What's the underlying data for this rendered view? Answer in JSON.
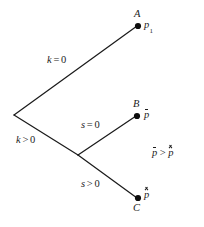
{
  "figure": {
    "type": "decision-tree-diagram",
    "background_color": "#ffffff",
    "ink_color": "#1b1b1b",
    "width": 204,
    "height": 227,
    "root_vertex": {
      "x": 14,
      "y": 115
    },
    "second_vertex": {
      "x": 78,
      "y": 155
    }
  },
  "edges": [
    {
      "id": "root-to-A",
      "label": "k = 0",
      "variable": "k",
      "operator": "=",
      "value": "0",
      "from": {
        "x": 14,
        "y": 115
      },
      "to": {
        "x": 137,
        "y": 26
      },
      "label_pos": {
        "x": 47,
        "y": 55
      }
    },
    {
      "id": "root-to-split",
      "label": "k > 0",
      "variable": "k",
      "operator": ">",
      "value": "0",
      "from": {
        "x": 14,
        "y": 115
      },
      "to": {
        "x": 78,
        "y": 155
      },
      "label_pos": {
        "x": 16,
        "y": 135
      }
    },
    {
      "id": "split-to-B",
      "label": "s = 0",
      "variable": "s",
      "operator": "=",
      "value": "0",
      "from": {
        "x": 78,
        "y": 155
      },
      "to": {
        "x": 136,
        "y": 116
      },
      "label_pos": {
        "x": 81,
        "y": 120
      }
    },
    {
      "id": "split-to-C",
      "label": "s > 0",
      "variable": "s",
      "operator": ">",
      "value": "0",
      "from": {
        "x": 78,
        "y": 155
      },
      "to": {
        "x": 137,
        "y": 198
      },
      "label_pos": {
        "x": 81,
        "y": 179
      }
    }
  ],
  "nodes": [
    {
      "id": "A",
      "letter": "A",
      "value_base": "p",
      "value_subscript": "1",
      "value_accent": "none",
      "dot": {
        "x": 138,
        "y": 26
      },
      "letter_pos": {
        "x": 134,
        "y": 9
      },
      "value_pos": {
        "x": 144,
        "y": 20
      }
    },
    {
      "id": "B",
      "letter": "B",
      "value_base": "p",
      "value_subscript": "",
      "value_accent": "bar",
      "dot": {
        "x": 137,
        "y": 116
      },
      "letter_pos": {
        "x": 133,
        "y": 99
      },
      "value_pos": {
        "x": 144,
        "y": 110
      }
    },
    {
      "id": "C",
      "letter": "C",
      "value_base": "p",
      "value_subscript": "",
      "value_accent": "hat",
      "dot": {
        "x": 138,
        "y": 198
      },
      "letter_pos": {
        "x": 133,
        "y": 203
      },
      "value_pos": {
        "x": 144,
        "y": 190
      }
    }
  ],
  "annotation": {
    "id": "inequality",
    "left_base": "p",
    "left_accent": "bar",
    "operator": ">",
    "right_base": "p",
    "right_accent": "hat",
    "text": "p̄ > p̂",
    "pos": {
      "x": 152,
      "y": 148
    }
  }
}
